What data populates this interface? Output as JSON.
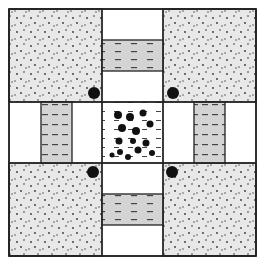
{
  "diagram": {
    "colors": {
      "background": "#ffffff",
      "stipple_fill": "#e8e8e8",
      "bar_fill": "#d4d4d4",
      "stroke": "#222222",
      "dot": "#111111",
      "white_cell": "#ffffff"
    },
    "layout": {
      "outer": [
        9,
        9,
        256,
        256
      ],
      "grid_lines": [
        9,
        102,
        163,
        256
      ]
    },
    "regions": [
      {
        "name": "corner-top-left",
        "type": "stippled",
        "x": 9,
        "y": 9,
        "w": 93,
        "h": 93
      },
      {
        "name": "corner-top-right",
        "type": "stippled",
        "x": 163,
        "y": 9,
        "w": 93,
        "h": 93
      },
      {
        "name": "corner-bottom-left",
        "type": "stippled",
        "x": 9,
        "y": 163,
        "w": 93,
        "h": 93
      },
      {
        "name": "corner-bottom-right",
        "type": "stippled",
        "x": 163,
        "y": 163,
        "w": 93,
        "h": 93
      },
      {
        "name": "bar-top",
        "type": "dashed-bar",
        "x": 102,
        "y": 40,
        "w": 61,
        "h": 31,
        "orientation": "horizontal"
      },
      {
        "name": "bar-bottom",
        "type": "dashed-bar",
        "x": 102,
        "y": 194,
        "w": 61,
        "h": 31,
        "orientation": "horizontal"
      },
      {
        "name": "bar-left",
        "type": "dashed-bar",
        "x": 41,
        "y": 102,
        "w": 31,
        "h": 61,
        "orientation": "vertical"
      },
      {
        "name": "bar-right",
        "type": "dashed-bar",
        "x": 194,
        "y": 102,
        "w": 31,
        "h": 61,
        "orientation": "vertical"
      },
      {
        "name": "center-cell",
        "type": "blobs",
        "x": 102,
        "y": 102,
        "w": 61,
        "h": 61
      }
    ],
    "corner_dots": [
      {
        "cx": 94,
        "cy": 93,
        "r": 6
      },
      {
        "cx": 173,
        "cy": 93,
        "r": 6
      },
      {
        "cx": 93,
        "cy": 172,
        "r": 6
      },
      {
        "cx": 172,
        "cy": 172,
        "r": 6
      }
    ],
    "center_blobs": [
      {
        "cx": 118,
        "cy": 115,
        "r": 4
      },
      {
        "cx": 130,
        "cy": 117,
        "r": 4
      },
      {
        "cx": 143,
        "cy": 113,
        "r": 3.5
      },
      {
        "cx": 122,
        "cy": 128,
        "r": 4
      },
      {
        "cx": 136,
        "cy": 131,
        "r": 4
      },
      {
        "cx": 150,
        "cy": 124,
        "r": 3.5
      },
      {
        "cx": 119,
        "cy": 141,
        "r": 3.5
      },
      {
        "cx": 133,
        "cy": 141,
        "r": 3
      },
      {
        "cx": 146,
        "cy": 143,
        "r": 3.5
      },
      {
        "cx": 120,
        "cy": 152,
        "r": 3
      },
      {
        "cx": 138,
        "cy": 150,
        "r": 3.5
      },
      {
        "cx": 152,
        "cy": 153,
        "r": 3
      },
      {
        "cx": 112,
        "cy": 155,
        "r": 2.5
      },
      {
        "cx": 128,
        "cy": 157,
        "r": 3
      }
    ]
  }
}
